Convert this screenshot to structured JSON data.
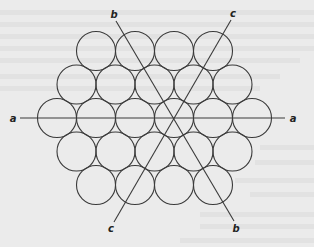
{
  "figure": {
    "packing": {
      "rows": [
        4,
        5,
        6,
        5,
        4
      ],
      "center_row_index": 2
    },
    "axes": [
      {
        "id": "a",
        "start_label": "a",
        "end_label": "a",
        "angle_deg": 0
      },
      {
        "id": "b",
        "start_label": "b",
        "end_label": "b",
        "angle_deg": -59
      },
      {
        "id": "c",
        "start_label": "c",
        "end_label": "c",
        "angle_deg": 60
      }
    ]
  },
  "colors": {
    "background": "#ebebeb",
    "stroke": "#3a3a3a",
    "label": "#222222"
  }
}
